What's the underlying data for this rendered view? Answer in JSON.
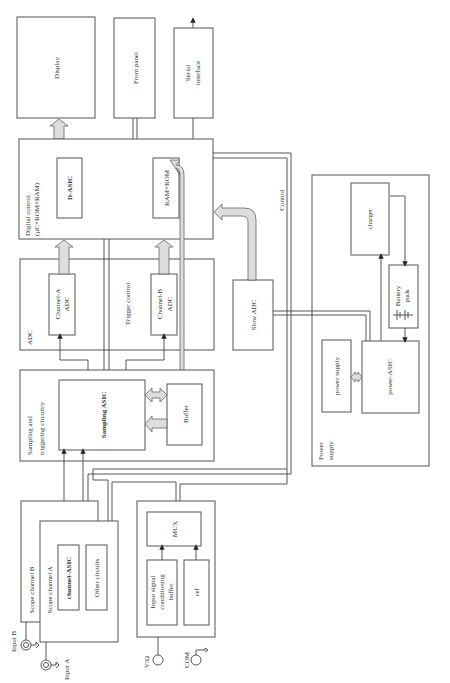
{
  "diagram": {
    "orientation": "rotated-90-ccw",
    "blocks": {
      "display": "Display",
      "front_panel": "Front panel",
      "serial_interface_l1": "Serial",
      "serial_interface_l2": "interface",
      "digital_control_l1": "Digital control",
      "digital_control_l2": "(µC+ROM+RAM)",
      "d_asic": "D-ASIC",
      "ram_rom": "RAM+ROM",
      "adc": "ADC",
      "channel_a_adc_l1": "Channel-A",
      "channel_a_adc_l2": "ADC",
      "trigger_control": "Trigger control",
      "channel_b_adc_l1": "Channel-B",
      "channel_b_adc_l2": "ADC",
      "slow_adc": "Slow ADC",
      "control": "Control",
      "sampling_l1": "Sampling and",
      "sampling_l2": "triggering circuitry",
      "sampling_asic": "Sampling ASIC",
      "buffer": "Buffer",
      "scope_channel_b": "Scope channel B",
      "scope_channel_a": "Scope channel A",
      "channel_asic": "channel-ASIC",
      "other_circuits": "Other circuits",
      "mux": "MUX",
      "input_buffer_l1": "Input signal",
      "input_buffer_l2": "conditioning",
      "input_buffer_l3": "buffer",
      "ref": "ref",
      "power_supply_l1": "Power",
      "power_supply_l2": "supply",
      "charger": "charger",
      "battery_l1": "Battery",
      "battery_l2": "pack",
      "power_supply_inner": "power supply",
      "power_asic": "power-ASIC"
    },
    "terminals": {
      "input_b": "Input B",
      "input_a": "Input A",
      "v_ohm": "V/Ω",
      "com": "COM"
    }
  }
}
